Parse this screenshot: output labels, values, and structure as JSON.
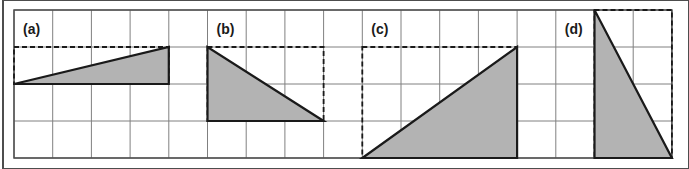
{
  "figure": {
    "title": "",
    "background_color": "#ffffff",
    "frame": {
      "outer_border_color": "#4d4d4d",
      "outer_border_x": 3,
      "outer_border_y": 0,
      "outer_border_width": 686,
      "outer_border_height": 169
    },
    "grid": {
      "origin_x": 14,
      "origin_y": 10,
      "cell_width": 38.7,
      "cell_height": 37.0,
      "columns": 17,
      "rows": 4,
      "line_color": "#808080",
      "line_width": 1,
      "border_color": "#4d4d4d",
      "border_width": 1.5,
      "visible": true
    },
    "style": {
      "triangle_fill": "#b3b3b3",
      "triangle_stroke": "#1a1a1a",
      "triangle_stroke_width": 2.2,
      "dashed_stroke": "#1a1a1a",
      "dashed_stroke_width": 1.8,
      "dash_pattern": "5,3"
    },
    "panels": [
      {
        "id": "a",
        "label": "(a)",
        "label_cell_col": 0,
        "label_cell_row": 0,
        "base_cells": 4,
        "height_cells": 1,
        "right_angle": "bottom-right",
        "triangle_cells": [
          {
            "col": 0,
            "row": 2
          },
          {
            "col": 4,
            "row": 2
          },
          {
            "col": 4,
            "row": 1
          }
        ],
        "bounding_box_cells": {
          "col": 0,
          "row": 1,
          "width": 4,
          "height": 1
        },
        "area_cells": 2
      },
      {
        "id": "b",
        "label": "(b)",
        "label_cell_col": 5,
        "label_cell_row": 0,
        "base_cells": 3,
        "height_cells": 2,
        "right_angle": "bottom-left",
        "triangle_cells": [
          {
            "col": 5,
            "row": 1
          },
          {
            "col": 5,
            "row": 3
          },
          {
            "col": 8,
            "row": 3
          }
        ],
        "bounding_box_cells": {
          "col": 5,
          "row": 1,
          "width": 3,
          "height": 2
        },
        "area_cells": 3
      },
      {
        "id": "c",
        "label": "(c)",
        "label_cell_col": 9,
        "label_cell_row": 0,
        "base_cells": 4,
        "height_cells": 3,
        "right_angle": "bottom-right",
        "triangle_cells": [
          {
            "col": 9,
            "row": 4
          },
          {
            "col": 13,
            "row": 4
          },
          {
            "col": 13,
            "row": 1
          }
        ],
        "bounding_box_cells": {
          "col": 9,
          "row": 1,
          "width": 4,
          "height": 3
        },
        "area_cells": 6
      },
      {
        "id": "d",
        "label": "(d)",
        "label_cell_col": 14,
        "label_cell_row": 0,
        "base_cells": 2,
        "height_cells": 4,
        "right_angle": "bottom-left",
        "triangle_cells": [
          {
            "col": 15,
            "row": 0
          },
          {
            "col": 15,
            "row": 4
          },
          {
            "col": 17,
            "row": 4
          }
        ],
        "bounding_box_cells": {
          "col": 15,
          "row": 0,
          "width": 2,
          "height": 4
        },
        "area_cells": 4
      }
    ]
  }
}
